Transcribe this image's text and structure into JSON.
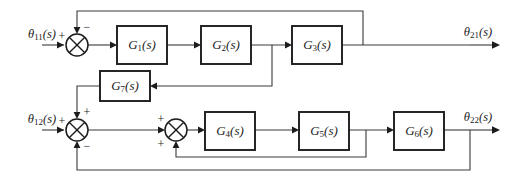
{
  "diagram": {
    "type": "control-system-block-diagram",
    "inputs": [
      {
        "id": "theta11",
        "base": "θ",
        "sub": "11",
        "suffix": "(s)",
        "label": "θ11(s)",
        "x": 42,
        "y": 38
      },
      {
        "id": "theta12",
        "base": "θ",
        "sub": "12",
        "suffix": "(s)",
        "label": "θ12(s)",
        "x": 42,
        "y": 123
      }
    ],
    "outputs": [
      {
        "id": "theta21",
        "base": "θ",
        "sub": "21",
        "suffix": "(s)",
        "label": "θ21(s)",
        "x": 476,
        "y": 33
      },
      {
        "id": "theta22",
        "base": "θ",
        "sub": "22",
        "suffix": "(s)",
        "label": "θ22(s)",
        "x": 476,
        "y": 118
      }
    ],
    "blocks": [
      {
        "id": "G1",
        "base": "G",
        "sub": "1",
        "suffix": "(s)",
        "label": "G1(s)",
        "x": 117,
        "y": 26,
        "w": 50,
        "h": 38
      },
      {
        "id": "G2",
        "base": "G",
        "sub": "2",
        "suffix": "(s)",
        "label": "G2(s)",
        "x": 201,
        "y": 26,
        "w": 50,
        "h": 38
      },
      {
        "id": "G3",
        "base": "G",
        "sub": "3",
        "suffix": "(s)",
        "label": "G3(s)",
        "x": 292,
        "y": 26,
        "w": 50,
        "h": 38
      },
      {
        "id": "G7",
        "base": "G",
        "sub": "7",
        "suffix": "(s)",
        "label": "G7(s)",
        "x": 100,
        "y": 71,
        "w": 50,
        "h": 30
      },
      {
        "id": "G4",
        "base": "G",
        "sub": "4",
        "suffix": "(s)",
        "label": "G4(s)",
        "x": 205,
        "y": 112,
        "w": 50,
        "h": 38
      },
      {
        "id": "G5",
        "base": "G",
        "sub": "5",
        "suffix": "(s)",
        "label": "G5(s)",
        "x": 299,
        "y": 112,
        "w": 50,
        "h": 38
      },
      {
        "id": "G6",
        "base": "G",
        "sub": "6",
        "suffix": "(s)",
        "label": "G6(s)",
        "x": 394,
        "y": 112,
        "w": 50,
        "h": 38
      }
    ],
    "summers": [
      {
        "id": "sum1",
        "cx": 77,
        "cy": 45,
        "r": 11,
        "signs": [
          {
            "text": "+",
            "x": 62,
            "y": 37
          },
          {
            "text": "−",
            "x": 86,
            "y": 28
          }
        ]
      },
      {
        "id": "sum2",
        "cx": 77,
        "cy": 130,
        "r": 11,
        "signs": [
          {
            "text": "+",
            "x": 62,
            "y": 122
          },
          {
            "text": "+",
            "x": 86,
            "y": 113
          },
          {
            "text": "−",
            "x": 86,
            "y": 147
          }
        ]
      },
      {
        "id": "sum3",
        "cx": 176,
        "cy": 130,
        "r": 11,
        "signs": [
          {
            "text": "+",
            "x": 161,
            "y": 122
          },
          {
            "text": "+",
            "x": 161,
            "y": 147
          }
        ]
      }
    ],
    "signs": {
      "plus": "+",
      "minus": "−"
    },
    "connections": [
      "theta11 -> sum1 (+)",
      "sum1 -> G1",
      "G1 -> G2",
      "G2 -> G3",
      "G3 -> theta21",
      "G3 output tap -> top feedback -> sum1 (-)",
      "G2 output tap -> down -> G7 input (right side)",
      "G7 output (left side) -> up/left -> sum2 (+ top)",
      "theta12 -> sum2 (+)",
      "sum2 -> sum3 (+ left)",
      "sum3 -> G4",
      "G4 -> G5",
      "G5 -> G6",
      "G6 -> theta22",
      "G5 output tap -> inner feedback -> sum3 (+ bottom)",
      "theta22 tap -> outer feedback -> sum2 (- bottom)"
    ]
  }
}
